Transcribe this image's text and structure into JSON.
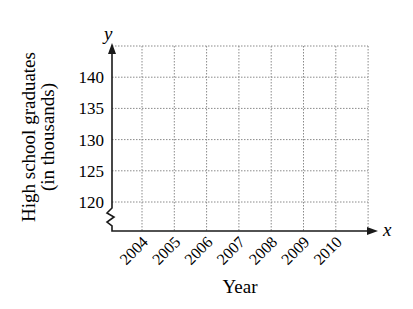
{
  "chart_data": {
    "type": "line",
    "title": "",
    "xlabel": "Year",
    "ylabel": "High school graduates (in thousands)",
    "ylabel_lines": [
      "High school graduates",
      "(in thousands)"
    ],
    "x_axis_variable": "x",
    "y_axis_variable": "y",
    "categories": [
      "2004",
      "2005",
      "2006",
      "2007",
      "2008",
      "2009",
      "2010"
    ],
    "x": [
      2004,
      2005,
      2006,
      2007,
      2008,
      2009,
      2010
    ],
    "series": [],
    "yticks": [
      120,
      125,
      130,
      135,
      140
    ],
    "ytick_labels": [
      "120",
      "125",
      "130",
      "135",
      "140"
    ],
    "ylim": [
      120,
      145
    ],
    "y_axis_break": true,
    "grid": true,
    "grid_style": "dotted",
    "legend": "none",
    "note": "Empty coordinate grid with no data plotted"
  },
  "colors": {
    "axis": "#1a1a1a",
    "grid": "#8a8a8a",
    "text": "#1a1a1a",
    "background": "#ffffff"
  }
}
